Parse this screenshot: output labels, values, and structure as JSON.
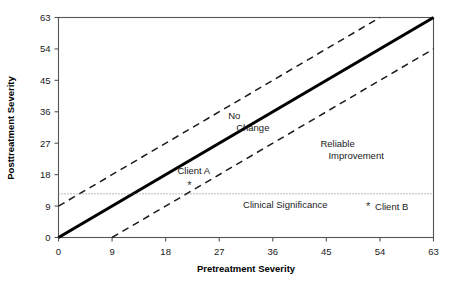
{
  "chart_data": {
    "type": "line",
    "title": "",
    "xlabel": "Pretreatment Severity",
    "ylabel": "Posttreatment Severity",
    "xlim": [
      0,
      63
    ],
    "ylim": [
      0,
      63
    ],
    "xticks": [
      "0",
      "9",
      "18",
      "27",
      "36",
      "45",
      "54",
      "63"
    ],
    "yticks": [
      "0",
      "9",
      "18",
      "27",
      "36",
      "45",
      "54",
      "63"
    ],
    "grid": false,
    "legend": "none",
    "series": [
      {
        "name": "No Change line",
        "style": "solid-thick",
        "x": [
          0,
          63
        ],
        "values": [
          0,
          63
        ]
      },
      {
        "name": "Upper reliable change band",
        "style": "dashed",
        "x": [
          0,
          54
        ],
        "values": [
          9,
          63
        ]
      },
      {
        "name": "Lower reliable change band",
        "style": "dashed",
        "x": [
          9,
          63
        ],
        "values": [
          0,
          54
        ]
      },
      {
        "name": "Clinical significance cutoff",
        "style": "dotted",
        "x": [
          0,
          63
        ],
        "values": [
          12.5,
          12.5
        ]
      }
    ],
    "points": [
      {
        "label": "Client A",
        "marker": "*",
        "x": 22,
        "y": 15
      },
      {
        "label": "Client B",
        "marker": "*",
        "x": 52,
        "y": 9
      }
    ],
    "annotations": [
      {
        "name": "no-change",
        "line1": "No",
        "line2": "Change",
        "x": 28.5,
        "y": 34
      },
      {
        "name": "reliable-improvement",
        "line1": "Reliable",
        "line2": "Improvement",
        "x": 44,
        "y": 26
      },
      {
        "name": "clinical-significance",
        "line1": "Clinical Significance",
        "line2": "",
        "x": 31,
        "y": 8.5
      }
    ]
  },
  "colors": {
    "line": "#000000",
    "band": "#1a1a1a",
    "cutoff": "#777777",
    "frame": "#555555",
    "text": "#1a1a1a",
    "background": "#ffffff"
  }
}
